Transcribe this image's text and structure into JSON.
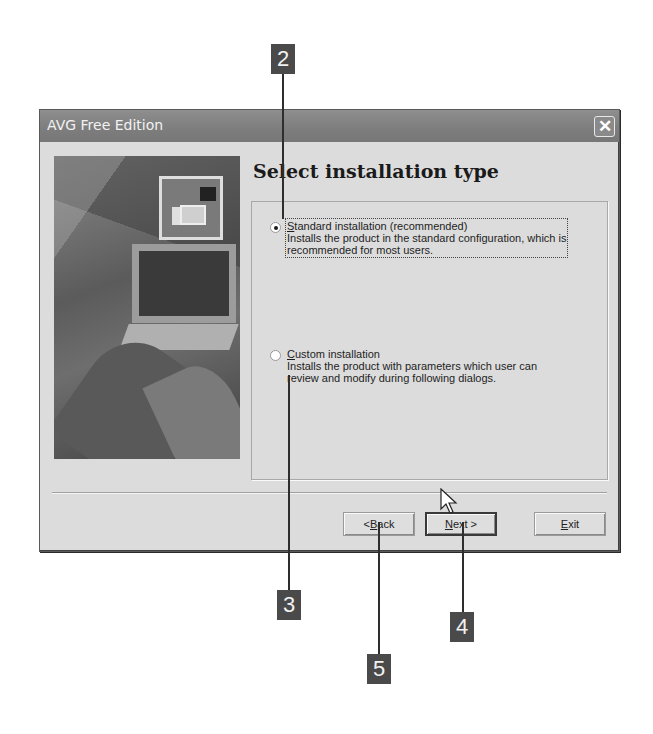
{
  "window": {
    "title": "AVG Free Edition",
    "close_label": "✕"
  },
  "page": {
    "heading": "Select installation type"
  },
  "options": [
    {
      "label_prefix": "",
      "label_accel": "S",
      "label_rest": "tandard installation (recommended)",
      "description_line1": "Installs the product in the standard configuration, which is",
      "description_line2": "recommended for most users.",
      "selected": true
    },
    {
      "label_prefix": "",
      "label_accel": "C",
      "label_rest": "ustom installation",
      "description_line1": "Installs the product with parameters which user can",
      "description_line2": "review and modify during following dialogs.",
      "selected": false
    }
  ],
  "buttons": {
    "back_prefix": "< ",
    "back_accel": "B",
    "back_rest": "ack",
    "next_accel": "N",
    "next_rest": "ext >",
    "exit_accel": "E",
    "exit_rest": "xit"
  },
  "callouts": [
    {
      "label": "2"
    },
    {
      "label": "3"
    },
    {
      "label": "4"
    },
    {
      "label": "5"
    }
  ]
}
